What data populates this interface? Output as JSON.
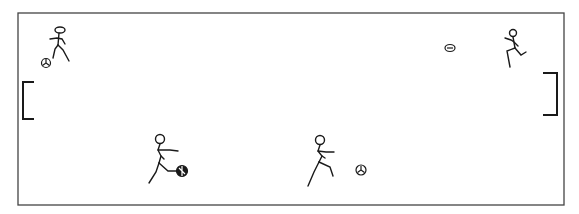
{
  "scene": {
    "description": "Stick-figure soccer field with goals, players and balls",
    "colors": {
      "line": "#1a1a1a",
      "field_border": "#444444",
      "background": "#ffffff"
    }
  },
  "field": {
    "x": 18,
    "y": 13,
    "width": 546,
    "height": 192
  },
  "goals": [
    {
      "name": "left-goal",
      "side": "left",
      "x": 22,
      "y": 82,
      "width": 12,
      "height": 37
    },
    {
      "name": "right-goal",
      "side": "right",
      "x": 544,
      "y": 73,
      "width": 12,
      "height": 42
    }
  ],
  "players": [
    {
      "name": "player-top-left",
      "x": 58,
      "y": 30
    },
    {
      "name": "player-top-right",
      "x": 512,
      "y": 33
    },
    {
      "name": "player-bottom-left",
      "x": 160,
      "y": 141
    },
    {
      "name": "player-bottom-center",
      "x": 319,
      "y": 141
    }
  ],
  "balls": [
    {
      "name": "ball-top-left",
      "x": 46,
      "y": 63,
      "r": 4.5
    },
    {
      "name": "ball-top-right",
      "x": 450,
      "y": 48,
      "r": 4.5
    },
    {
      "name": "ball-bottom-left",
      "x": 182,
      "y": 171,
      "r": 5.5
    },
    {
      "name": "ball-bottom-center",
      "x": 361,
      "y": 170,
      "r": 5
    }
  ]
}
